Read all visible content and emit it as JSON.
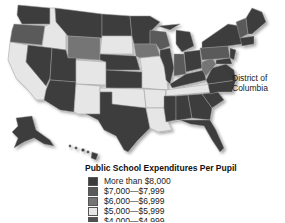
{
  "title": "Public School Expenditures Per Pupil",
  "annotation": {
    "dc_label_line1": "District of",
    "dc_label_line2": "Columbia"
  },
  "legend": {
    "title": "Public School Expenditures Per Pupil",
    "items": [
      {
        "label": "More than $8,000",
        "color": "#3c3c3c"
      },
      {
        "label": "$7,000—$7,999",
        "color": "#5a5a5a"
      },
      {
        "label": "$6,000—$6,999",
        "color": "#757575"
      },
      {
        "label": "$5,000—$5,999",
        "color": "#e6e6e6"
      },
      {
        "label": "$4,000—$4,999",
        "color": "#505050"
      }
    ]
  },
  "map": {
    "region": "United States",
    "shading_colors": {
      "darkest": "#3c3c3c",
      "dark": "#505050",
      "medium_dark": "#5a5a5a",
      "medium": "#757575",
      "light": "#e6e6e6"
    }
  }
}
